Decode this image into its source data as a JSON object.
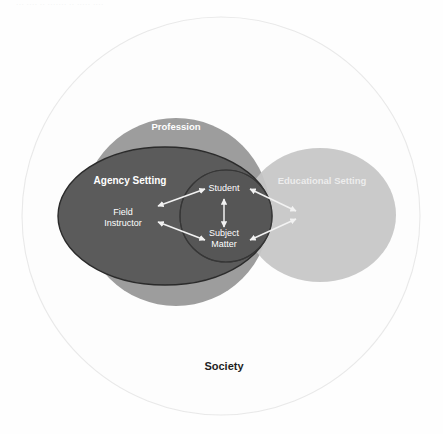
{
  "figure": {
    "type": "venn-diagram",
    "title_text_visible": false,
    "background_color": "#fefefe",
    "scan_artifact_text": "··· ···· ·· ······· ·· ····· ····"
  },
  "shapes": {
    "society": {
      "label": "Society",
      "shape": "circle",
      "fill": "#fdfdfd",
      "stroke": "#e8e8e8",
      "label_color": "#1f1f1f",
      "label_position": "bottom-center",
      "cx": 221,
      "cy": 216,
      "r": 199
    },
    "profession": {
      "label": "Profession",
      "shape": "circle",
      "fill": "#9d9d9d",
      "stroke": "none",
      "label_color": "#ffffff",
      "label_position": "top-center",
      "cx": 176,
      "cy": 212,
      "r": 94
    },
    "agency_setting": {
      "label": "Agency Setting",
      "shape": "ellipse",
      "fill": "#5b5b5b",
      "stroke": "#2a2a2a",
      "label_color": "#ffffff",
      "label_position": "left-upper",
      "cx": 165,
      "cy": 216,
      "rx": 107,
      "ry": 69
    },
    "educational_setting": {
      "label": "Educational Setting",
      "shape": "ellipse",
      "fill": "#c6c6c6",
      "stroke": "none",
      "label_color": "#f0f0f0",
      "label_position": "right-upper",
      "cx": 320,
      "cy": 215,
      "rx": 76,
      "ry": 67
    },
    "overlap_lens": {
      "label": "",
      "shape": "circle",
      "fill": "#555555",
      "stroke": "#2f2f2f",
      "cx": 226,
      "cy": 216,
      "r": 46
    }
  },
  "nodes": [
    {
      "id": "student",
      "label": "Student",
      "lines": [
        "Student"
      ],
      "x": 224,
      "y": 188,
      "color": "#ffffff"
    },
    {
      "id": "field-instructor",
      "label": "Field Instructor",
      "lines": [
        "Field",
        "Instructor"
      ],
      "x": 123,
      "y": 217,
      "color": "#ffffff"
    },
    {
      "id": "subject-matter",
      "label": "Subject Matter",
      "lines": [
        "Subject",
        "Matter"
      ],
      "x": 224,
      "y": 237,
      "color": "#ffffff"
    }
  ],
  "connectors": [
    {
      "id": "student-subject-matter",
      "from": "student",
      "to": "subject-matter",
      "direction": "bidirectional",
      "orientation": "vertical",
      "color": "#f2f2f2"
    },
    {
      "id": "field-instructor-student",
      "from": "field-instructor",
      "to": "student",
      "direction": "bidirectional",
      "orientation": "diagonal-up-right",
      "color": "#f2f2f2"
    },
    {
      "id": "field-instructor-subject-matter",
      "from": "field-instructor",
      "to": "subject-matter",
      "direction": "bidirectional",
      "orientation": "diagonal-down-right",
      "color": "#f2f2f2"
    },
    {
      "id": "student-educational-setting",
      "from": "student",
      "to": "educational_setting",
      "direction": "bidirectional",
      "orientation": "diagonal-down-right",
      "color": "#f2f2f2"
    },
    {
      "id": "subject-matter-educational-setting",
      "from": "subject-matter",
      "to": "educational_setting",
      "direction": "bidirectional",
      "orientation": "diagonal-up-right",
      "color": "#f2f2f2"
    }
  ],
  "labels": {
    "profession": {
      "text": "Profession",
      "x": 176,
      "y": 130
    },
    "agency_setting": {
      "text": "Agency Setting",
      "x": 130,
      "y": 184
    },
    "educational_setting": {
      "text": "Educational Setting",
      "x": 322,
      "y": 184
    },
    "society": {
      "text": "Society",
      "x": 224,
      "y": 370
    }
  }
}
